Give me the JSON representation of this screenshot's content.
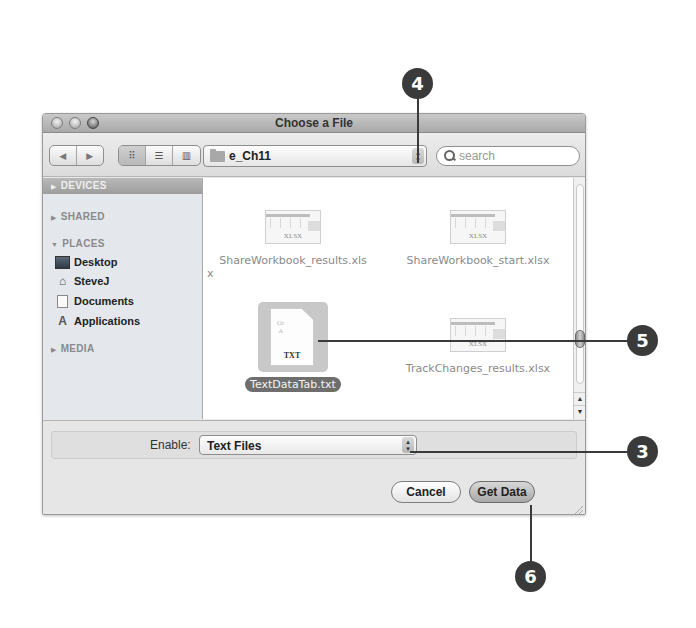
{
  "window": {
    "title": "Choose a File",
    "traffic_lights": [
      "close",
      "minimize",
      "zoom"
    ]
  },
  "toolbar": {
    "nav_back_icon": "◀",
    "nav_forward_icon": "▶",
    "view_icons": [
      "⠿",
      "☰",
      "▥"
    ],
    "path_popup": "e_Ch11",
    "stepper": "▴▾",
    "search_placeholder": "search"
  },
  "sidebar": {
    "sections": [
      {
        "label": "DEVICES",
        "expanded": false,
        "selected": true
      },
      {
        "label": "SHARED",
        "expanded": false,
        "selected": false
      },
      {
        "label": "PLACES",
        "expanded": true,
        "selected": false
      },
      {
        "label": "MEDIA",
        "expanded": false,
        "selected": false
      }
    ],
    "places": [
      {
        "label": "Desktop",
        "icon": "desktop-icon"
      },
      {
        "label": "SteveJ",
        "icon": "home-icon"
      },
      {
        "label": "Documents",
        "icon": "documents-icon"
      },
      {
        "label": "Applications",
        "icon": "applications-icon"
      }
    ],
    "tri_right": "▶",
    "tri_down": "▼"
  },
  "files": [
    {
      "name": "ShareWorkbook_results.xlsx",
      "name_line1": "ShareWorkbook_results.xls",
      "name_line2": "x",
      "type": "XLSX",
      "selected": false
    },
    {
      "name": "ShareWorkbook_start.xlsx",
      "type": "XLSX",
      "selected": false
    },
    {
      "name": "TextDataTab.txt",
      "type": "TXT",
      "selected": true
    },
    {
      "name": "TrackChanges_results.xlsx",
      "type": "XLSX",
      "selected": false
    }
  ],
  "scrollbar": {
    "up": "▲",
    "down": "▼"
  },
  "enable": {
    "label": "Enable:",
    "value": "Text Files"
  },
  "buttons": {
    "cancel": "Cancel",
    "ok": "Get Data"
  },
  "callouts": [
    {
      "number": "4",
      "target": "path-popup"
    },
    {
      "number": "5",
      "target": "TextDataTab.txt"
    },
    {
      "number": "3",
      "target": "enable-popup"
    },
    {
      "number": "6",
      "target": "get-data-button"
    }
  ]
}
